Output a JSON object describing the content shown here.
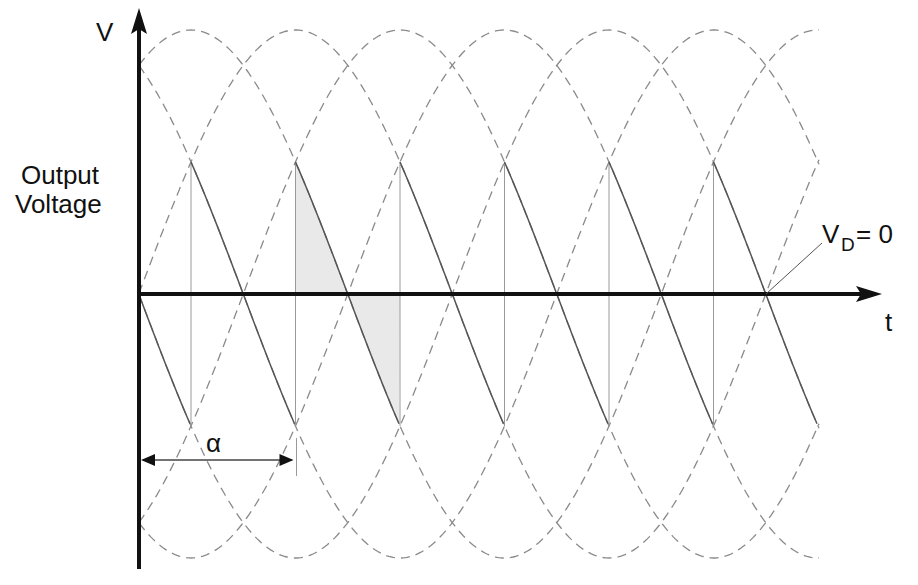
{
  "diagram": {
    "y_axis_label": "V",
    "y_axis_caption_line1": "Output",
    "y_axis_caption_line2": "Voltage",
    "x_axis_label": "t",
    "angle_label": "α",
    "vd_label_main": "V",
    "vd_label_sub": "D",
    "vd_label_eq": "= 0"
  },
  "geometry": {
    "origin_x": 139,
    "origin_y": 294,
    "y_axis_top": 8,
    "y_axis_bottom": 569,
    "x_axis_right": 882,
    "amplitude": 264,
    "period_px": 627,
    "first_peak_x": 191,
    "phase_step_px": 104.5,
    "curve_x_start": 139,
    "curve_x_end": 820,
    "firing_lines_x": [
      191,
      295.5,
      400,
      504.5,
      609,
      713.5
    ],
    "output_segment_end_x": 818,
    "shaded_interval": [
      295.5,
      400
    ],
    "alpha_arrow": {
      "x1": 139,
      "x2": 295.5,
      "y": 460
    },
    "vd_pointer": {
      "x1": 766,
      "y1": 294,
      "x2": 822,
      "y2": 243
    }
  },
  "colors": {
    "axis": "#111111",
    "dashed_phase": "#8a8a8a",
    "output_segment": "#555555",
    "firing_line": "#9a9a9a",
    "shade": "#e9e9e9"
  },
  "legend_semantics": {
    "dashed_curves": "Phase-to-phase supply voltages (six sinusoids, 60° apart)",
    "solid_segments": "Rectifier output voltage at firing angle α",
    "shaded_area": "Positive and negative volt-second area within one pulse",
    "vd_note": "Average output voltage V_D = 0"
  }
}
